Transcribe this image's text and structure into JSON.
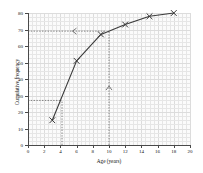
{
  "chart_data": {
    "type": "line",
    "title": "",
    "xlabel": "Age (years)",
    "ylabel": "Cumulative frequency",
    "xlim": [
      0,
      20
    ],
    "ylim": [
      0,
      80
    ],
    "xticks": [
      0,
      2,
      4,
      6,
      8,
      10,
      12,
      14,
      16,
      18,
      20
    ],
    "yticks": [
      0,
      10,
      20,
      30,
      40,
      50,
      60,
      70,
      80
    ],
    "grid": true,
    "legend": "none",
    "x": [
      3,
      6,
      9,
      12,
      15,
      18
    ],
    "values": [
      15,
      51,
      67,
      73,
      78,
      80
    ],
    "marker": "x",
    "annotations": [
      {
        "name": "median-read-off-horizontal",
        "type": "dashed-guide-horizontal",
        "y": 69,
        "x_from": 0,
        "x_to": 9.5,
        "arrow": "left"
      },
      {
        "name": "age-10-read-up-vertical",
        "type": "dashed-guide-vertical",
        "x": 10,
        "y_from": 0,
        "y_to": 69,
        "arrow": "up"
      },
      {
        "name": "lower-read-off-horizontal",
        "type": "dashed-guide-horizontal",
        "y": 27,
        "x_from": 0,
        "x_to": 4.2
      },
      {
        "name": "lower-read-off-vertical",
        "type": "dashed-guide-vertical",
        "x": 4.2,
        "y_from": 0,
        "y_to": 27
      }
    ]
  },
  "colors": {
    "curve": "#3a3a3a",
    "axis": "#4a4a4a",
    "grid": "#e6e6e6",
    "guide": "#555555",
    "plot_bg": "#fbfbfb",
    "page_bg": "#ffffff"
  }
}
